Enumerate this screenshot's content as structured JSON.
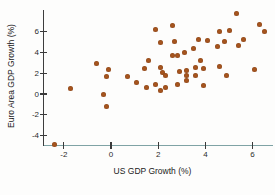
{
  "chart_data": {
    "type": "scatter",
    "title": "",
    "xlabel": "US GDP Growth (%)",
    "ylabel": "Euro Area GDP Growth (%)",
    "xlim": [
      -2.9,
      7.0
    ],
    "ylim": [
      -5.0,
      8.3
    ],
    "grid": false,
    "legend": "none",
    "x_ticks": [
      -2,
      0,
      2,
      4,
      6
    ],
    "x_tick_labels": [
      "-2",
      "0",
      "2",
      "4",
      "6"
    ],
    "y_ticks": [
      -4,
      -2,
      0,
      2,
      4,
      6
    ],
    "y_tick_labels": [
      "-4",
      "-2",
      "0",
      "2",
      "4",
      "6"
    ],
    "point_color": "#a9571f",
    "x_axis_color": "#7fa3a5",
    "y_axis_color": "#3d3d3d",
    "text_color": "#2b2b2b",
    "points": [
      [
        -2.4,
        -4.9
      ],
      [
        -1.7,
        0.5
      ],
      [
        -0.6,
        2.9
      ],
      [
        -0.1,
        2.4
      ],
      [
        -0.2,
        1.7
      ],
      [
        -0.3,
        0.0
      ],
      [
        -0.2,
        -1.2
      ],
      [
        0.7,
        1.7
      ],
      [
        1.1,
        1.1
      ],
      [
        1.4,
        2.5
      ],
      [
        1.5,
        0.6
      ],
      [
        1.6,
        3.2
      ],
      [
        1.9,
        6.2
      ],
      [
        1.9,
        0.9
      ],
      [
        2.1,
        5.0
      ],
      [
        2.1,
        2.6
      ],
      [
        2.1,
        0.3
      ],
      [
        2.2,
        2.1
      ],
      [
        2.3,
        1.8
      ],
      [
        2.3,
        0.6
      ],
      [
        2.6,
        6.6
      ],
      [
        2.6,
        3.7
      ],
      [
        2.7,
        5.1
      ],
      [
        2.8,
        3.7
      ],
      [
        2.8,
        0.9
      ],
      [
        2.9,
        2.2
      ],
      [
        3.1,
        4.0
      ],
      [
        3.2,
        2.3
      ],
      [
        3.2,
        1.8
      ],
      [
        3.2,
        1.3
      ],
      [
        3.5,
        4.4
      ],
      [
        3.6,
        2.6
      ],
      [
        3.6,
        1.8
      ],
      [
        3.7,
        5.3
      ],
      [
        3.8,
        3.2
      ],
      [
        3.9,
        2.5
      ],
      [
        3.9,
        0.8
      ],
      [
        4.1,
        5.2
      ],
      [
        4.5,
        4.6
      ],
      [
        4.6,
        6.0
      ],
      [
        4.6,
        2.7
      ],
      [
        4.8,
        5.1
      ],
      [
        4.9,
        1.8
      ],
      [
        5.0,
        6.1
      ],
      [
        5.3,
        7.8
      ],
      [
        5.4,
        4.7
      ],
      [
        5.6,
        5.3
      ],
      [
        6.1,
        2.4
      ],
      [
        6.3,
        6.7
      ],
      [
        6.5,
        6.0
      ]
    ]
  }
}
